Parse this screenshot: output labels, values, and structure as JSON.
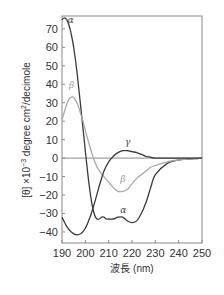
{
  "chart_data": {
    "type": "line",
    "title": "",
    "xlabel": "波長 (nm)",
    "ylabel": "[θ] ×10⁻³ degree cm²/decimole",
    "xlim": [
      190,
      250
    ],
    "ylim": [
      -46,
      77
    ],
    "xticks": [
      190,
      200,
      210,
      220,
      230,
      240,
      250
    ],
    "yticks": [
      -40,
      -30,
      -20,
      -10,
      0,
      10,
      20,
      30,
      40,
      50,
      60,
      70
    ],
    "grid": false,
    "legend": "inline labels",
    "reference_line": 0,
    "series": [
      {
        "name": "α",
        "color": "#3a3a3a",
        "x": [
          190,
          191,
          192,
          193,
          194,
          195,
          196,
          197,
          198,
          199,
          200,
          201,
          202,
          203,
          204,
          205,
          206,
          207,
          208,
          209,
          210,
          212,
          214,
          216,
          218,
          220,
          222,
          224,
          226,
          228,
          230,
          235,
          240,
          245,
          250
        ],
        "y": [
          75,
          76,
          75,
          72,
          67,
          60,
          51,
          40,
          28,
          16,
          4,
          -8,
          -18,
          -26,
          -31,
          -33,
          -33,
          -32,
          -32,
          -33,
          -33,
          -33,
          -32,
          -32,
          -34,
          -35,
          -34,
          -30,
          -24,
          -16,
          -9,
          -3,
          -1,
          -0.5,
          0
        ]
      },
      {
        "name": "β",
        "color": "#a8a8a8",
        "x": [
          190,
          191,
          192,
          193,
          194,
          195,
          196,
          197,
          198,
          199,
          200,
          202,
          204,
          206,
          208,
          210,
          212,
          214,
          216,
          218,
          220,
          222,
          224,
          226,
          228,
          230,
          235,
          240,
          245,
          250
        ],
        "y": [
          21,
          25,
          29,
          32,
          33,
          33,
          31,
          28,
          24,
          20,
          15,
          6,
          -2,
          -7,
          -10,
          -13,
          -16,
          -18,
          -18,
          -17,
          -14,
          -11,
          -9,
          -7,
          -5,
          -4,
          -2,
          -1,
          -0.5,
          0
        ]
      },
      {
        "name": "γ",
        "color": "#3a3a3a",
        "x": [
          190,
          192,
          194,
          196,
          198,
          200,
          202,
          204,
          206,
          208,
          210,
          212,
          214,
          216,
          218,
          220,
          222,
          224,
          226,
          228,
          230,
          235,
          240,
          245,
          250
        ],
        "y": [
          -32,
          -37,
          -40,
          -41.5,
          -41,
          -38,
          -32,
          -24,
          -15,
          -7,
          -2,
          1,
          3,
          4,
          4,
          3.5,
          3,
          2,
          1,
          0.5,
          0,
          0,
          0,
          0,
          0
        ]
      }
    ],
    "annotations": [
      {
        "text": "α",
        "x": 192.5,
        "y": 73
      },
      {
        "text": "β",
        "x": 193,
        "y": 38
      },
      {
        "text": "γ",
        "x": 217,
        "y": 7
      },
      {
        "text": "β",
        "x": 215,
        "y": -13
      },
      {
        "text": "α",
        "x": 215,
        "y": -30
      }
    ]
  },
  "axes": {
    "xlabel": "波長 (nm)",
    "ylabel_prefix": "[θ] ×10",
    "ylabel_exp": "−3",
    "ylabel_mid": " degree cm",
    "ylabel_exp2": "2",
    "ylabel_suffix": "/decimole"
  }
}
